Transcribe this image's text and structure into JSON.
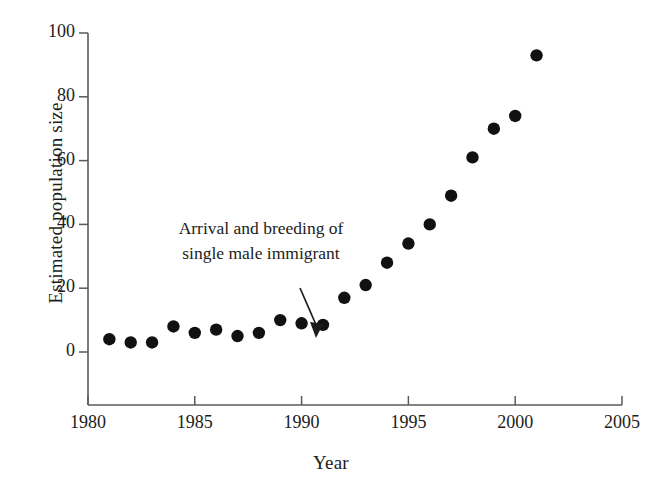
{
  "chart_data": {
    "type": "scatter",
    "title": "",
    "xlabel": "Year",
    "ylabel": "Estimated population size",
    "xlim": [
      1980,
      2005
    ],
    "ylim": [
      0,
      100
    ],
    "xticks": [
      1980,
      1985,
      1990,
      1995,
      2000,
      2005
    ],
    "yticks": [
      0,
      20,
      40,
      60,
      80,
      100
    ],
    "xtick_labels": [
      "1980",
      "1985",
      "1990",
      "1995",
      "2000",
      "2005"
    ],
    "ytick_labels": [
      "0",
      "20",
      "40",
      "60",
      "80",
      "100"
    ],
    "grid": false,
    "legend": false,
    "marker": "filled-circle",
    "marker_color": "#111111",
    "x": [
      1981,
      1982,
      1983,
      1984,
      1985,
      1986,
      1987,
      1988,
      1989,
      1990,
      1991,
      1992,
      1993,
      1994,
      1995,
      1996,
      1997,
      1998,
      1999,
      2000,
      2001
    ],
    "values": [
      4,
      3,
      3,
      8,
      6,
      7,
      5,
      6,
      10,
      9,
      8.5,
      17,
      21,
      28,
      34,
      40,
      49,
      61,
      70,
      74,
      93
    ],
    "annotations": [
      {
        "text_line1": "Arrival and breeding of",
        "text_line2": "single male immigrant",
        "points_to_x": 1991,
        "points_to_y": 12
      }
    ]
  },
  "axis": {
    "y_label": "Estimated population size",
    "x_label": "Year"
  },
  "annotation": {
    "line1": "Arrival and breeding of",
    "line2": "single male immigrant"
  },
  "colors": {
    "marker": "#111111",
    "axis": "#4a4a4a",
    "text": "#1c1c1c",
    "background": "#ffffff"
  }
}
